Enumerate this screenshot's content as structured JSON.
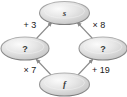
{
  "diagram": {
    "type": "flow-diagram",
    "shape": "diamond",
    "background_color": "#ffffff",
    "node_fill_color": "#d9d9d9",
    "node_border_color": "#808080",
    "edge_color": "#8a8a8a",
    "label_color": "#1a1a1a",
    "nodes": [
      {
        "id": "top",
        "label": "s",
        "style": "italic",
        "position": "top"
      },
      {
        "id": "left",
        "label": "?",
        "style": "regular",
        "position": "left"
      },
      {
        "id": "right",
        "label": "?",
        "style": "regular",
        "position": "right"
      },
      {
        "id": "bottom",
        "label": "f",
        "style": "italic",
        "position": "bottom"
      }
    ],
    "edges": [
      {
        "id": "left-to-top",
        "from": "left",
        "to": "top",
        "label": "+ 3",
        "label_position": "upper-left"
      },
      {
        "id": "right-to-top",
        "from": "right",
        "to": "top",
        "label": "× 8",
        "label_position": "upper-right"
      },
      {
        "id": "bottom-to-left",
        "from": "bottom",
        "to": "left",
        "label": "× 7",
        "label_position": "lower-left"
      },
      {
        "id": "bottom-to-right",
        "from": "bottom",
        "to": "right",
        "label": "+ 19",
        "label_position": "lower-right"
      }
    ]
  }
}
